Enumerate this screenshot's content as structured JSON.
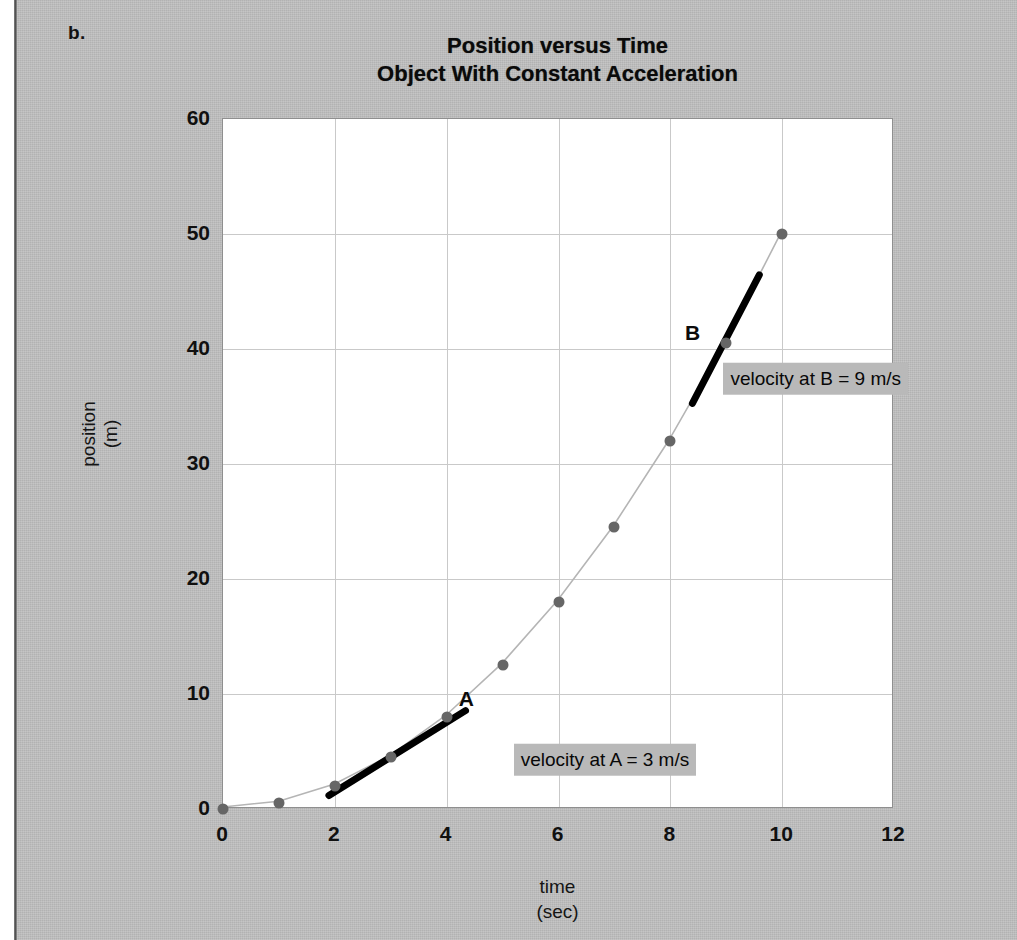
{
  "figure": {
    "part_label": "b.",
    "title_line1": "Position versus Time",
    "title_line2": "Object With Constant Acceleration"
  },
  "chart_data": {
    "type": "scatter",
    "title": "Position versus Time Object With Constant Acceleration",
    "xlabel": "time (sec)",
    "ylabel": "position (m)",
    "xlabel_line1": "time",
    "xlabel_line2": "(sec)",
    "ylabel_line1": "position",
    "ylabel_line2": "(m)",
    "xlim": [
      0,
      12
    ],
    "ylim": [
      0,
      60
    ],
    "xticks": [
      0,
      2,
      4,
      6,
      8,
      10,
      12
    ],
    "yticks": [
      0,
      10,
      20,
      30,
      40,
      50,
      60
    ],
    "grid": true,
    "legend": "none",
    "series": [
      {
        "name": "position",
        "marker": "filled-circle",
        "marker_color": "#666666",
        "line_color": "#b5b5b5",
        "x": [
          0,
          1,
          2,
          3,
          4,
          5,
          6,
          7,
          8,
          9,
          10
        ],
        "y": [
          0,
          0.5,
          2,
          4.5,
          8,
          12.5,
          18,
          24.5,
          32,
          40.5,
          50
        ]
      }
    ],
    "annotations": [
      {
        "id": "A",
        "letter": "A",
        "letter_x": 4.35,
        "letter_y": 9.6,
        "tangent": {
          "x0": 1.9,
          "y0": 1.0,
          "x1": 4.35,
          "y1": 8.4,
          "color": "#000000",
          "width_px": 7
        },
        "callout": "velocity at A = 3 m/s",
        "callout_x": 5.2,
        "callout_y": 4.3
      },
      {
        "id": "B",
        "letter": "B",
        "letter_x": 8.4,
        "letter_y": 41.4,
        "tangent": {
          "x0": 8.42,
          "y0": 35.2,
          "x1": 9.62,
          "y1": 46.4,
          "color": "#000000",
          "width_px": 7
        },
        "callout": "velocity at B = 9 m/s",
        "callout_x": 8.95,
        "callout_y": 37.4
      }
    ]
  }
}
